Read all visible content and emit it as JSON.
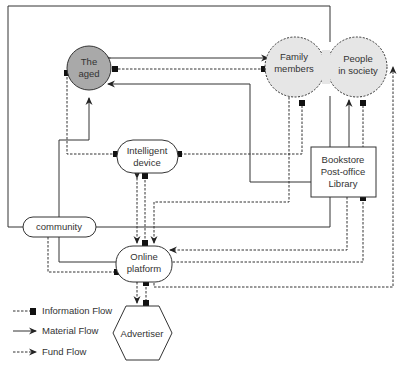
{
  "nodes": {
    "aged": {
      "line1": "The",
      "line2": "aged",
      "fill": "#a9a9a9"
    },
    "family": {
      "line1": "Family",
      "line2": "members",
      "fill": "#e6e6e6"
    },
    "society": {
      "line1": "People",
      "line2": "in society",
      "fill": "#e6e6e6"
    },
    "device": {
      "line1": "Intelligent",
      "line2": "device"
    },
    "bookstore": {
      "line1": "Bookstore",
      "line2": "Post-office",
      "line3": "Library"
    },
    "community": {
      "label": "community"
    },
    "platform": {
      "line1": "Online",
      "line2": "platform"
    },
    "advertiser": {
      "label": "Advertiser"
    }
  },
  "legend": {
    "information": "Information Flow",
    "material": "Material Flow",
    "fund": "Fund Flow"
  }
}
